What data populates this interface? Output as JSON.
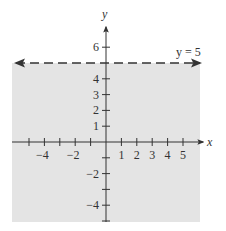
{
  "chart_data": {
    "type": "inequality-graph",
    "title": "",
    "xlabel": "x",
    "ylabel": "y",
    "xlim": [
      -6,
      6
    ],
    "ylim": [
      -5,
      7
    ],
    "grid": false,
    "x_ticks": [
      -5,
      -4,
      -3,
      -2,
      -1,
      1,
      2,
      3,
      4,
      5
    ],
    "x_tick_labels": [
      {
        "value": -4,
        "label": "−4"
      },
      {
        "value": -2,
        "label": "−2"
      },
      {
        "value": 1,
        "label": "1"
      },
      {
        "value": 2,
        "label": "2"
      },
      {
        "value": 3,
        "label": "3"
      },
      {
        "value": 4,
        "label": "4"
      },
      {
        "value": 5,
        "label": "5"
      }
    ],
    "y_ticks": [
      -5,
      -4,
      -3,
      -2,
      -1,
      1,
      2,
      3,
      4,
      6
    ],
    "y_tick_labels": [
      {
        "value": 6,
        "label": "6"
      },
      {
        "value": 4,
        "label": "4"
      },
      {
        "value": 3,
        "label": "3"
      },
      {
        "value": 2,
        "label": "2"
      },
      {
        "value": 1,
        "label": "1"
      },
      {
        "value": -2,
        "label": "−2"
      },
      {
        "value": -4,
        "label": "−4"
      }
    ],
    "boundary_line": {
      "equation": "y = 5",
      "label": "y = 5",
      "style": "dashed",
      "arrows": "both"
    },
    "shaded_region": {
      "description": "y < 5",
      "side": "below",
      "color": "#e4e4e4"
    },
    "colors": {
      "axis": "#333333",
      "boundary": "#333333",
      "shade": "#e4e4e4"
    }
  }
}
